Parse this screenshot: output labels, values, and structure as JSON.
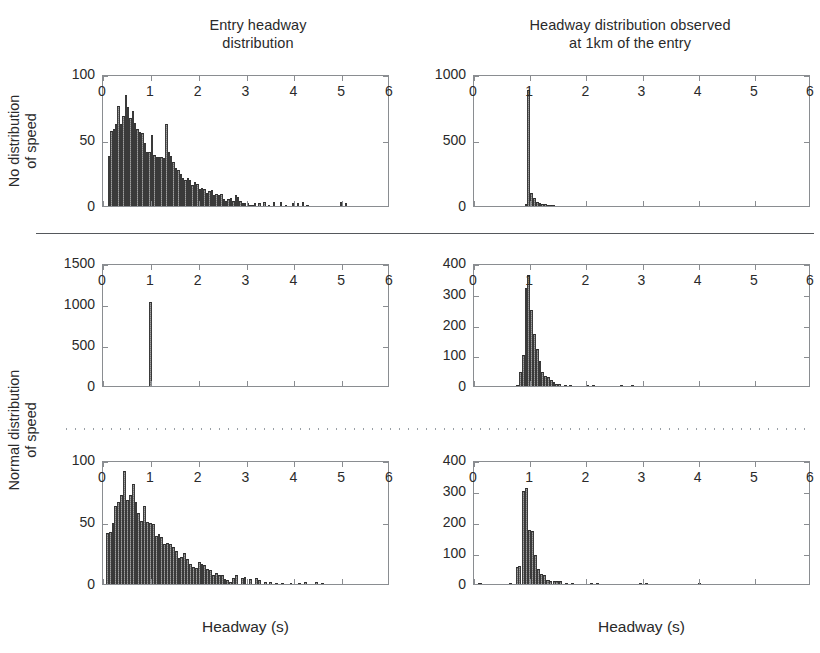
{
  "figure": {
    "column_titles": [
      {
        "id": "entry",
        "line1": "Entry headway",
        "line2": "distribution"
      },
      {
        "id": "observed",
        "line1": "Headway distribution observed",
        "line2": "at 1km of the entry"
      }
    ],
    "row_labels": [
      {
        "id": "no-distribution-of-speed",
        "line1": "No distribution",
        "line2": "of speed"
      },
      {
        "id": "normal-distribution-of-speed",
        "line1": "Normal distribution",
        "line2": "of speed"
      }
    ],
    "axis_title_x": "Headway (s)",
    "bar_color": "#575757",
    "axis_color": "#8a8d91",
    "text_color": "#2a2a2a"
  },
  "chart_data": [
    {
      "id": "panel-top-left",
      "type": "bar",
      "title": "Entry headway distribution",
      "row": "No distribution of speed",
      "xlabel": "Headway (s)",
      "ylabel": "",
      "xlim": [
        0,
        6
      ],
      "ylim": [
        0,
        100
      ],
      "xticks": [
        0,
        1,
        2,
        3,
        4,
        5,
        6
      ],
      "xtick_labels": [
        "0",
        "1",
        "2",
        "3",
        "4",
        "5",
        "6"
      ],
      "yticks": [
        0,
        50,
        100
      ],
      "ytick_labels": [
        "0",
        "50",
        "100"
      ],
      "grid": false,
      "bin_width": 0.05,
      "bin_starts": [
        0.1,
        0.15,
        0.2,
        0.25,
        0.3,
        0.35,
        0.4,
        0.45,
        0.5,
        0.55,
        0.6,
        0.65,
        0.7,
        0.75,
        0.8,
        0.85,
        0.9,
        0.95,
        1.0,
        1.05,
        1.1,
        1.15,
        1.2,
        1.25,
        1.3,
        1.35,
        1.4,
        1.45,
        1.5,
        1.55,
        1.6,
        1.65,
        1.7,
        1.75,
        1.8,
        1.85,
        1.9,
        1.95,
        2.0,
        2.05,
        2.1,
        2.15,
        2.2,
        2.25,
        2.3,
        2.35,
        2.4,
        2.45,
        2.5,
        2.55,
        2.6,
        2.65,
        2.7,
        2.75,
        2.8,
        2.85,
        2.9,
        2.95,
        3.0,
        3.05,
        3.1,
        3.15,
        3.25,
        3.35,
        3.45,
        3.55,
        3.7,
        3.8,
        3.95,
        4.05,
        4.15,
        4.25,
        4.95,
        5.05
      ],
      "values": [
        38,
        57,
        58,
        62,
        76,
        62,
        68,
        84,
        75,
        67,
        72,
        63,
        58,
        56,
        55,
        48,
        41,
        41,
        54,
        39,
        37,
        37,
        37,
        36,
        62,
        41,
        38,
        33,
        29,
        27,
        24,
        21,
        20,
        21,
        20,
        16,
        18,
        17,
        13,
        14,
        13,
        10,
        11,
        12,
        8,
        9,
        8,
        9,
        5,
        4,
        5,
        6,
        4,
        8,
        7,
        4,
        2,
        2,
        2,
        1,
        1,
        2,
        2,
        3,
        1,
        3,
        3,
        1,
        2,
        2,
        3,
        1,
        3,
        2
      ]
    },
    {
      "id": "panel-top-right",
      "type": "bar",
      "title": "Headway distribution observed at 1km of the entry",
      "row": "No distribution of speed",
      "xlabel": "Headway (s)",
      "ylabel": "",
      "xlim": [
        0,
        6
      ],
      "ylim": [
        0,
        1000
      ],
      "xticks": [
        0,
        1,
        2,
        3,
        4,
        5,
        6
      ],
      "xtick_labels": [
        "0",
        "1",
        "2",
        "3",
        "4",
        "5",
        "6"
      ],
      "yticks": [
        0,
        500,
        1000
      ],
      "ytick_labels": [
        "0",
        "500",
        "1000"
      ],
      "grid": false,
      "bin_width": 0.05,
      "bin_starts": [
        0.9,
        0.95,
        1.0,
        1.05,
        1.1,
        1.15,
        1.2,
        1.25,
        1.3,
        1.35,
        1.4
      ],
      "values": [
        18,
        880,
        100,
        62,
        34,
        24,
        18,
        12,
        8,
        4,
        3
      ]
    },
    {
      "id": "panel-middle-left",
      "type": "bar",
      "title": "Entry headway distribution",
      "row": "Normal distribution of speed",
      "xlabel": "Headway (s)",
      "ylabel": "",
      "xlim": [
        0,
        6
      ],
      "ylim": [
        0,
        1500
      ],
      "xticks": [
        0,
        1,
        2,
        3,
        4,
        5,
        6
      ],
      "xtick_labels": [
        "0",
        "1",
        "2",
        "3",
        "4",
        "5",
        "6"
      ],
      "yticks": [
        0,
        500,
        1000,
        1500
      ],
      "ytick_labels": [
        "0",
        "500",
        "1000",
        "1500"
      ],
      "grid": false,
      "bin_width": 0.05,
      "bin_starts": [
        0.97
      ],
      "values": [
        1020
      ]
    },
    {
      "id": "panel-middle-right",
      "type": "bar",
      "title": "Headway distribution observed at 1km of the entry",
      "row": "Normal distribution of speed",
      "xlabel": "Headway (s)",
      "ylabel": "",
      "xlim": [
        0,
        6
      ],
      "ylim": [
        0,
        400
      ],
      "xticks": [
        0,
        1,
        2,
        3,
        4,
        5,
        6
      ],
      "xtick_labels": [
        "0",
        "1",
        "2",
        "3",
        "4",
        "5",
        "6"
      ],
      "yticks": [
        0,
        100,
        200,
        300,
        400
      ],
      "ytick_labels": [
        "0",
        "100",
        "200",
        "300",
        "400"
      ],
      "grid": false,
      "bin_width": 0.05,
      "bin_starts": [
        0.75,
        0.8,
        0.85,
        0.9,
        0.95,
        1.0,
        1.05,
        1.1,
        1.15,
        1.2,
        1.25,
        1.3,
        1.35,
        1.4,
        1.45,
        1.5,
        1.6,
        1.7,
        2.0,
        2.1,
        2.6,
        2.8
      ],
      "values": [
        4,
        47,
        100,
        320,
        360,
        248,
        170,
        120,
        80,
        47,
        33,
        30,
        18,
        12,
        8,
        5,
        3,
        2,
        3,
        2,
        2,
        1
      ]
    },
    {
      "id": "panel-bottom-left",
      "type": "bar",
      "title": "Entry headway distribution",
      "row": "Normal distribution of speed",
      "xlabel": "Headway (s)",
      "ylabel": "",
      "xlim": [
        0,
        6
      ],
      "ylim": [
        0,
        100
      ],
      "xticks": [
        0,
        1,
        2,
        3,
        4,
        5,
        6
      ],
      "xtick_labels": [
        "0",
        "1",
        "2",
        "3",
        "4",
        "5",
        "6"
      ],
      "yticks": [
        0,
        50,
        100
      ],
      "ytick_labels": [
        "0",
        "50",
        "100"
      ],
      "grid": false,
      "bin_width": 0.06,
      "bin_starts": [
        0.06,
        0.12,
        0.18,
        0.24,
        0.3,
        0.36,
        0.42,
        0.48,
        0.54,
        0.6,
        0.66,
        0.72,
        0.78,
        0.84,
        0.9,
        0.96,
        1.02,
        1.08,
        1.14,
        1.2,
        1.26,
        1.32,
        1.38,
        1.44,
        1.5,
        1.56,
        1.62,
        1.68,
        1.74,
        1.8,
        1.86,
        1.92,
        1.98,
        2.04,
        2.1,
        2.16,
        2.22,
        2.28,
        2.34,
        2.4,
        2.46,
        2.52,
        2.58,
        2.64,
        2.7,
        2.76,
        2.88,
        2.94,
        3.06,
        3.18,
        3.24,
        3.36,
        3.48,
        3.6,
        3.72,
        3.9,
        4.08,
        4.2,
        4.44,
        4.56
      ],
      "values": [
        41,
        42,
        49,
        63,
        66,
        72,
        91,
        68,
        72,
        81,
        66,
        57,
        51,
        63,
        50,
        49,
        48,
        39,
        40,
        38,
        32,
        33,
        32,
        30,
        27,
        21,
        22,
        25,
        20,
        16,
        14,
        13,
        18,
        16,
        15,
        12,
        11,
        7,
        9,
        7,
        7,
        4,
        3,
        2,
        5,
        7,
        5,
        6,
        4,
        5,
        3,
        2,
        2,
        1,
        1,
        1,
        1,
        2,
        2,
        1
      ]
    },
    {
      "id": "panel-bottom-right",
      "type": "bar",
      "title": "Headway distribution observed at 1km of the entry",
      "row": "Normal distribution of speed",
      "xlabel": "Headway (s)",
      "ylabel": "",
      "xlim": [
        0,
        6
      ],
      "ylim": [
        0,
        400
      ],
      "xticks": [
        0,
        1,
        2,
        3,
        4,
        5,
        6
      ],
      "xtick_labels": [
        "0",
        "1",
        "2",
        "3",
        "4",
        "5",
        "6"
      ],
      "yticks": [
        0,
        100,
        200,
        300,
        400
      ],
      "ytick_labels": [
        "0",
        "100",
        "200",
        "300",
        "400"
      ],
      "grid": false,
      "bin_width": 0.055,
      "bin_starts": [
        0.08,
        0.63,
        0.74,
        0.79,
        0.85,
        0.9,
        0.96,
        1.01,
        1.07,
        1.12,
        1.18,
        1.23,
        1.29,
        1.34,
        1.4,
        1.45,
        1.51,
        1.62,
        1.73,
        2.06,
        2.17,
        2.94,
        3.05,
        3.98
      ],
      "values": [
        2,
        4,
        55,
        58,
        300,
        310,
        175,
        170,
        95,
        50,
        33,
        30,
        12,
        11,
        10,
        9,
        9,
        4,
        4,
        2,
        2,
        2,
        2,
        1
      ]
    }
  ]
}
